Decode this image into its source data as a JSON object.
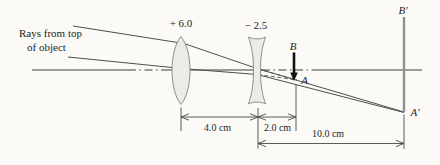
{
  "figure": {
    "type": "optics-two-lens-ray-diagram",
    "annotations": {
      "rays_note_line1": "Rays from top",
      "rays_note_line2": "of object"
    },
    "lenses": [
      {
        "id": "converging-lens",
        "label": "+ 6.0"
      },
      {
        "id": "diverging-lens",
        "label": "− 2.5"
      }
    ],
    "points": {
      "B": "B",
      "A": "A",
      "B_prime": "B′",
      "A_prime": "A′"
    },
    "dimensions": [
      {
        "id": "lens1-to-lens2",
        "label": "4.0 cm"
      },
      {
        "id": "lens2-to-point-A",
        "label": "2.0 cm"
      },
      {
        "id": "lens2-to-final-image",
        "label": "10.0 cm"
      }
    ],
    "colors": {
      "background": "#fbfaf6",
      "ink": "#1f1f1f",
      "ray": "#4d4d4d",
      "lens_fill": "#ebebe7",
      "lens_stroke": "#8e8e8e",
      "image_line": "#8f9091",
      "arrow_ink": "#111111"
    }
  }
}
